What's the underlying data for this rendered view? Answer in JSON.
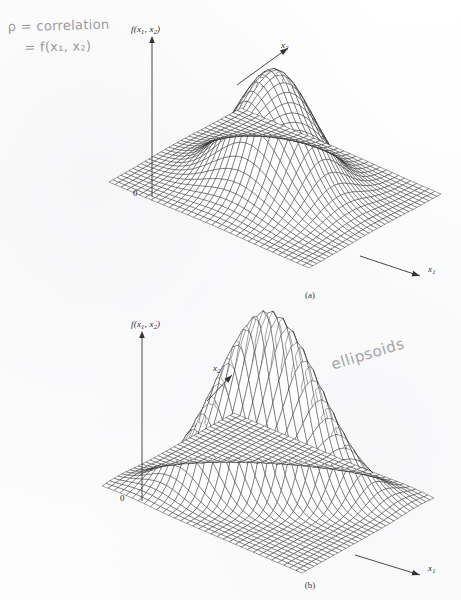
{
  "page": {
    "background": "#fefefe",
    "ink_color": "#2b2b2b",
    "pencil_color": "#8f8f93"
  },
  "annotations": {
    "correlation_line1": "ρ = correlation",
    "correlation_line2": "= f(x₁, x₂)",
    "ellipsoids": "ellipsoids"
  },
  "panels": [
    {
      "id": "a",
      "caption": "(a)",
      "vertical_axis_label": "f(x",
      "vertical_axis_sub1": "1",
      "vertical_axis_mid": ", x",
      "vertical_axis_sub2": "2",
      "vertical_axis_end": ")",
      "x1_label": "x",
      "x1_sub": "1",
      "x2_label": "x",
      "x2_sub": "2",
      "origin": "0"
    },
    {
      "id": "b",
      "caption": "(b)",
      "vertical_axis_label": "f(x",
      "vertical_axis_sub1": "1",
      "vertical_axis_mid": ", x",
      "vertical_axis_sub2": "2",
      "vertical_axis_end": ")",
      "x1_label": "x",
      "x1_sub": "1",
      "x2_label": "x",
      "x2_sub": "2",
      "origin": "0"
    }
  ],
  "chart_data": [
    {
      "type": "surface",
      "panel": "a",
      "title": "",
      "xlabel": "x1",
      "ylabel": "x2",
      "zlabel": "f(x1, x2)",
      "surface": "bivariate-normal-density",
      "description": "Wireframe mesh surface of a bivariate normal probability density with zero correlation; circular symmetric bell shape centred on the base plane.",
      "parameters": {
        "rho": 0.0,
        "mu1": 0.0,
        "mu2": 0.0,
        "sigma1": 1.0,
        "sigma2": 1.0,
        "peak_height": 1.0
      },
      "grid": {
        "nx": 34,
        "ny": 34,
        "x_range": [
          -3.0,
          3.0
        ],
        "y_range": [
          -3.0,
          3.0
        ]
      },
      "projection": {
        "type": "isometric",
        "elevation_deg": 22,
        "azimuth_deg": 45
      },
      "axis_origin_tick": "0",
      "grid_visible": true,
      "legend": "none"
    },
    {
      "type": "surface",
      "panel": "b",
      "title": "",
      "xlabel": "x1",
      "ylabel": "x2",
      "zlabel": "f(x1, x2)",
      "surface": "bivariate-normal-density",
      "description": "Wireframe mesh surface of a bivariate normal probability density with strong positive correlation; the bell is stretched into an elongated ridge whose contours are ellipsoids.",
      "parameters": {
        "rho": 0.75,
        "mu1": 0.0,
        "mu2": 0.0,
        "sigma1": 1.0,
        "sigma2": 1.0,
        "peak_height": 1.55
      },
      "grid": {
        "nx": 34,
        "ny": 34,
        "x_range": [
          -3.0,
          3.0
        ],
        "y_range": [
          -3.0,
          3.0
        ]
      },
      "projection": {
        "type": "isometric",
        "elevation_deg": 22,
        "azimuth_deg": 45
      },
      "axis_origin_tick": "0",
      "grid_visible": true,
      "legend": "none"
    }
  ]
}
